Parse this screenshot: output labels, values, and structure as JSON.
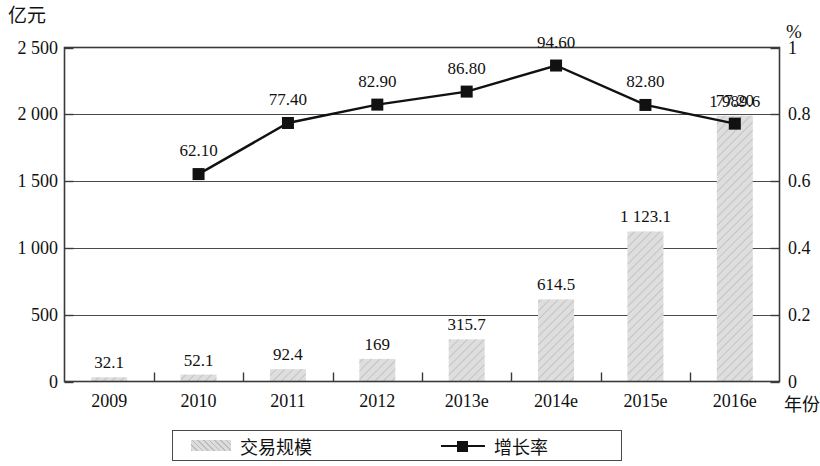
{
  "chart_data": {
    "type": "bar",
    "title": "",
    "subtitle": "",
    "categories": [
      "2009",
      "2010",
      "2011",
      "2012",
      "2013e",
      "2014e",
      "2015e",
      "2016e"
    ],
    "series": [
      {
        "name": "交易规模",
        "type": "bar",
        "axis": "left",
        "values": [
          32.1,
          52.1,
          92.4,
          169,
          315.7,
          614.5,
          1123.1,
          1989.6
        ],
        "labels": [
          "32.1",
          "52.1",
          "92.4",
          "169",
          "315.7",
          "614.5",
          "1 123.1",
          "1 989.6"
        ],
        "color": "#dcdcdc"
      },
      {
        "name": "增长率",
        "type": "line",
        "axis": "right",
        "values": [
          null,
          0.621,
          0.774,
          0.829,
          0.868,
          0.946,
          0.828,
          0.772
        ],
        "labels": [
          "",
          "62.10",
          "77.40",
          "82.90",
          "86.80",
          "94.60",
          "82.80",
          "77.20"
        ],
        "color": "#111111"
      }
    ],
    "xlabel": "年份",
    "ylabel": "亿元",
    "y2label": "%",
    "ylim": [
      0,
      2500
    ],
    "y2lim": [
      0,
      1
    ],
    "yticks": [
      "0",
      "500",
      "1 000",
      "1 500",
      "2 000",
      "2 500"
    ],
    "ytick_values": [
      0,
      500,
      1000,
      1500,
      2000,
      2500
    ],
    "y2ticks": [
      "0",
      "0.2",
      "0.4",
      "0.6",
      "0.8",
      "1"
    ],
    "y2tick_values": [
      0,
      0.2,
      0.4,
      0.6,
      0.8,
      1
    ],
    "grid": true,
    "legend_position": "bottom"
  },
  "legend": {
    "bar_label": "交易规模",
    "line_label": "增长率"
  }
}
